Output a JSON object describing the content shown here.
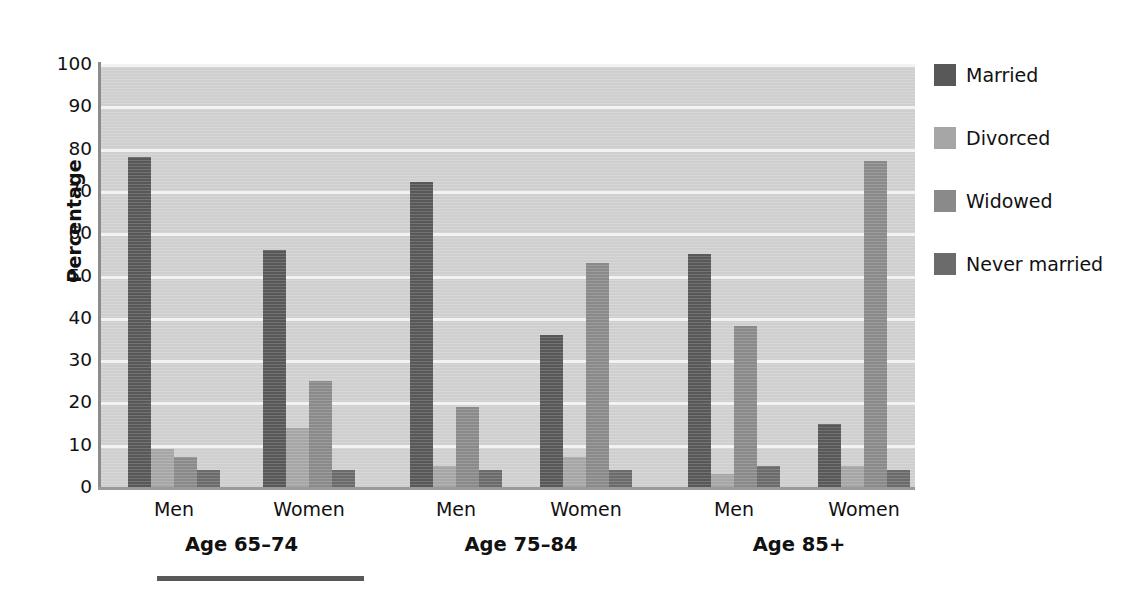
{
  "chart_data": {
    "type": "bar",
    "title": "",
    "subtitle": "",
    "xlabel": "",
    "ylabel": "Percentage",
    "ylim": [
      0,
      100
    ],
    "ytick_step": 10,
    "yticks": [
      100,
      90,
      80,
      70,
      60,
      50,
      40,
      30,
      20,
      10,
      0
    ],
    "grid": "horizontal",
    "legend_position": "right",
    "categories": [
      "Men",
      "Women",
      "Men",
      "Women",
      "Men",
      "Women"
    ],
    "groups": [
      {
        "age_label": "Age 65–74",
        "subgroups": [
          {
            "sex": "Men",
            "values": [
              78,
              9,
              7,
              4
            ]
          },
          {
            "sex": "Women",
            "values": [
              56,
              14,
              25,
              4
            ]
          }
        ]
      },
      {
        "age_label": "Age 75–84",
        "subgroups": [
          {
            "sex": "Men",
            "values": [
              72,
              5,
              19,
              4
            ]
          },
          {
            "sex": "Women",
            "values": [
              36,
              7,
              53,
              4
            ]
          }
        ]
      },
      {
        "age_label": "Age 85+",
        "subgroups": [
          {
            "sex": "Men",
            "values": [
              55,
              3,
              38,
              5
            ]
          },
          {
            "sex": "Women",
            "values": [
              15,
              5,
              77,
              4
            ]
          }
        ]
      }
    ],
    "series": [
      {
        "name": "Married",
        "color": "#585858",
        "values": [
          78,
          56,
          72,
          36,
          55,
          15
        ]
      },
      {
        "name": "Divorced",
        "color": "#a6a6a6",
        "values": [
          9,
          14,
          5,
          7,
          3,
          5
        ]
      },
      {
        "name": "Widowed",
        "color": "#8a8a8a",
        "values": [
          7,
          25,
          19,
          53,
          38,
          77
        ]
      },
      {
        "name": "Never married",
        "color": "#6b6b6b",
        "values": [
          4,
          4,
          4,
          4,
          5,
          4
        ]
      }
    ]
  },
  "legend": {
    "items": [
      {
        "label": "Married",
        "color": "#585858"
      },
      {
        "label": "Divorced",
        "color": "#a6a6a6"
      },
      {
        "label": "Widowed",
        "color": "#8a8a8a"
      },
      {
        "label": "Never married",
        "color": "#6b6b6b"
      }
    ]
  },
  "axes": {
    "y_title": "Percentage",
    "plot_background": "#cfcfcf",
    "gridline_color": "#f2f2f2"
  }
}
